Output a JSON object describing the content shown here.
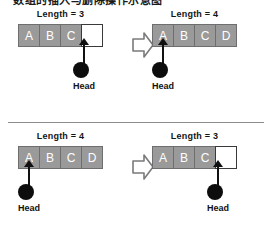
{
  "heading": {
    "text": "数组的插入与删除操作示意图"
  },
  "diagram": {
    "type": "array-operations",
    "icons": {
      "transition_arrow": "block-arrow-right-icon",
      "pointer_arrow": "arrow-up-icon",
      "pointer_node": "filled-circle-icon"
    },
    "panels": [
      {
        "id": "insert",
        "before": {
          "length_label": "Length = 3",
          "cells": [
            {
              "value": "A",
              "state": "filled"
            },
            {
              "value": "B",
              "state": "filled"
            },
            {
              "value": "C",
              "state": "filled"
            },
            {
              "value": "",
              "state": "empty"
            }
          ],
          "head": {
            "label": "Head",
            "cell_index": 3
          }
        },
        "after": {
          "length_label": "Length = 4",
          "cells": [
            {
              "value": "A",
              "state": "filled"
            },
            {
              "value": "B",
              "state": "filled"
            },
            {
              "value": "C",
              "state": "filled"
            },
            {
              "value": "D",
              "state": "filled"
            }
          ],
          "head": {
            "label": "Head",
            "cell_index": 0
          }
        }
      },
      {
        "id": "delete",
        "before": {
          "length_label": "Length = 4",
          "cells": [
            {
              "value": "A",
              "state": "filled"
            },
            {
              "value": "B",
              "state": "filled"
            },
            {
              "value": "C",
              "state": "filled"
            },
            {
              "value": "D",
              "state": "filled"
            }
          ],
          "head": {
            "label": "Head",
            "cell_index": 0
          }
        },
        "after": {
          "length_label": "Length = 3",
          "cells": [
            {
              "value": "A",
              "state": "filled"
            },
            {
              "value": "B",
              "state": "filled"
            },
            {
              "value": "C",
              "state": "filled"
            },
            {
              "value": "",
              "state": "empty"
            }
          ],
          "head": {
            "label": "Head",
            "cell_index": 3
          }
        }
      }
    ]
  },
  "colors": {
    "cell_fill": "#9a9a9a",
    "cell_border": "#6e6e6e",
    "cell_text": "#ffffff",
    "empty_fill": "#ffffff",
    "empty_border": "#3a3a3a",
    "pointer": "#0d0d0d",
    "divider": "#8d8d8d",
    "arrow_outline": "#7a7a7a"
  }
}
